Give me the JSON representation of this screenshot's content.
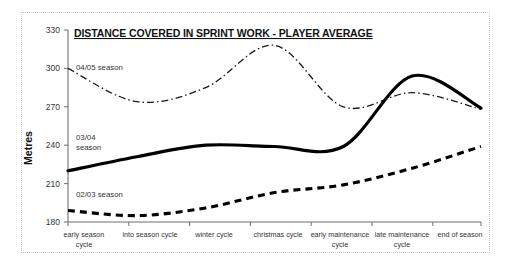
{
  "chart_data": {
    "type": "line",
    "title": "DISTANCE COVERED IN SPRINT WORK - PLAYER AVERAGE",
    "xlabel": "",
    "ylabel": "Metres",
    "ylim": [
      180,
      330
    ],
    "yticks": [
      180,
      210,
      240,
      270,
      300,
      330
    ],
    "grid": false,
    "legend_position": "inline-annotations",
    "categories": [
      "early season cycle",
      "into season cycle",
      "winter cycle",
      "christmas cycle",
      "early maintenance cycle",
      "late maintenance cycle",
      "end of season"
    ],
    "series": [
      {
        "name": "02/03 season",
        "style": "dashed",
        "values": [
          189,
          185,
          191,
          203,
          209,
          222,
          239
        ]
      },
      {
        "name": "03/04 season",
        "style": "solid-thick",
        "values": [
          220,
          231,
          240,
          239,
          239,
          294,
          269
        ]
      },
      {
        "name": "04/05 season",
        "style": "dash-dot",
        "values": [
          300,
          274,
          285,
          318,
          270,
          281,
          268
        ]
      }
    ]
  },
  "annotations": {
    "series_0405_label": "04/05 season",
    "series_0304_label_line1": "03/04",
    "series_0304_label_line2": "season",
    "series_0203_label": "02/03 season"
  },
  "axis": {
    "y_tick_labels": [
      "330",
      "300",
      "270",
      "240",
      "210",
      "180"
    ],
    "y_axis_title": "Metres",
    "x_tick_labels": [
      {
        "line1": "early season",
        "line2": "cycle"
      },
      {
        "line1": "into season cycle",
        "line2": ""
      },
      {
        "line1": "winter cycle",
        "line2": ""
      },
      {
        "line1": "christmas cycle",
        "line2": ""
      },
      {
        "line1": "early maintenance",
        "line2": "cycle"
      },
      {
        "line1": "late maintenance",
        "line2": "cycle"
      },
      {
        "line1": "end of season",
        "line2": ""
      }
    ]
  },
  "colors": {
    "line": "#000000",
    "axis": "#6f6f6f",
    "text": "#333333",
    "frame": "#c8c8c8",
    "background": "#ffffff"
  }
}
